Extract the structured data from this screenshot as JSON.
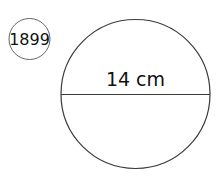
{
  "problem": {
    "number": "1899"
  },
  "figure": {
    "shape": "circle",
    "diameter_label": "14 cm",
    "stroke_color": "#3a3a3a",
    "text_color": "#111111"
  }
}
